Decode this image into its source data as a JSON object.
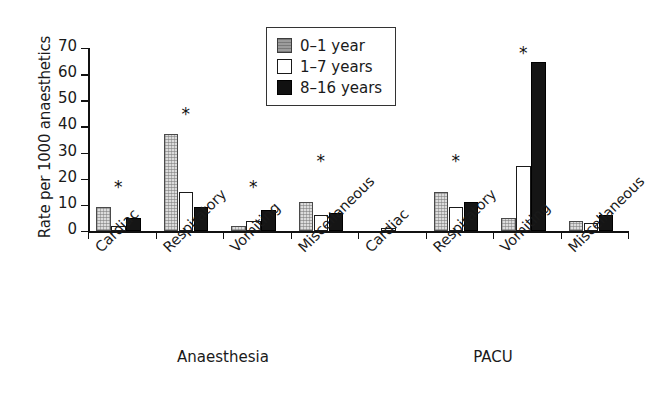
{
  "chart_data": {
    "type": "bar",
    "title": "",
    "xlabel": "",
    "ylabel": "Rate per 1000 anaesthetics",
    "ylim": [
      0,
      70
    ],
    "yticks": [
      0,
      10,
      20,
      30,
      40,
      50,
      60,
      70
    ],
    "grid": false,
    "legend_position": "top-center",
    "groups": [
      "Anaesthesia",
      "PACU"
    ],
    "categories": [
      "Cardiac",
      "Respiratory",
      "Vomiting",
      "Miscellaneous",
      "Cardiac",
      "Respiratory",
      "Vomiting",
      "Miscellaneous"
    ],
    "series": [
      {
        "name": "0–1 year",
        "color": "#dcdcdc",
        "values": [
          9,
          37,
          2,
          11,
          0,
          15,
          5,
          4
        ]
      },
      {
        "name": "1–7 years",
        "color": "#ffffff",
        "values": [
          2,
          15,
          4,
          6,
          1,
          9,
          25,
          3
        ]
      },
      {
        "name": "8–16 years",
        "color": "#151515",
        "values": [
          5,
          9,
          8,
          7,
          0,
          11,
          64.5,
          6
        ]
      }
    ],
    "annotations": [
      {
        "label": "*",
        "category_index": 0,
        "value": 20
      },
      {
        "label": "*",
        "category_index": 1,
        "value": 48
      },
      {
        "label": "*",
        "category_index": 2,
        "value": 20
      },
      {
        "label": "*",
        "category_index": 3,
        "value": 30
      },
      {
        "label": "*",
        "category_index": 5,
        "value": 30
      },
      {
        "label": "*",
        "category_index": 6,
        "value": 71
      }
    ],
    "group_label_positions": [
      1.5,
      5.5
    ]
  },
  "legend": {
    "items": [
      {
        "label": "0–1 year"
      },
      {
        "label": "1–7 years"
      },
      {
        "label": "8–16 years"
      }
    ]
  },
  "axis": {
    "y_title": "Rate per 1000 anaesthetics",
    "y_tick_labels": [
      "0",
      "10",
      "20",
      "30",
      "40",
      "50",
      "60",
      "70"
    ]
  },
  "group_labels": [
    {
      "text": "Anaesthesia"
    },
    {
      "text": "PACU"
    }
  ]
}
